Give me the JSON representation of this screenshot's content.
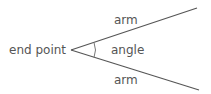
{
  "diagram": {
    "labels": {
      "vertex": "end point",
      "arm_top": "arm",
      "arm_bottom": "arm",
      "angle": "angle"
    },
    "colors": {
      "line": "#555555",
      "text": "#555555"
    }
  }
}
